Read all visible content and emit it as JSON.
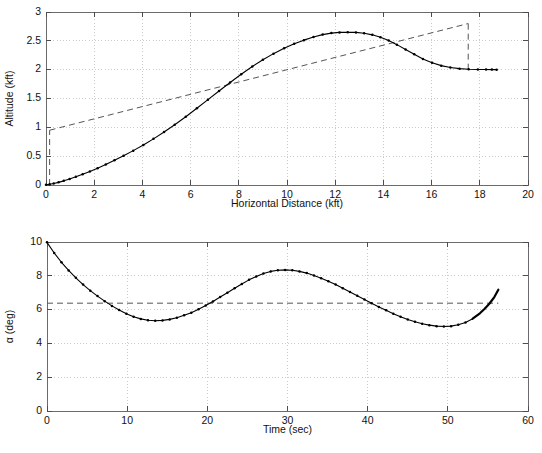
{
  "figure": {
    "title": "",
    "background": "#ffffff",
    "axis_color": "#4d4d4d",
    "grid_color": "#bdbdbd",
    "curve_color": "#000000",
    "refline_color": "#555555"
  },
  "chart_data": [
    {
      "id": "altitude-vs-distance",
      "type": "line",
      "title": "",
      "xlabel": "Horizontal Distance (kft)",
      "ylabel": "Altitude (kft)",
      "xlim": [
        0,
        20
      ],
      "ylim": [
        0,
        3
      ],
      "xticks": [
        0,
        2,
        4,
        6,
        8,
        10,
        12,
        14,
        16,
        18,
        20
      ],
      "xticklabels": [
        "0",
        "2",
        "4",
        "6",
        "8",
        "10",
        "12",
        "14",
        "16",
        "18",
        "20"
      ],
      "yticks": [
        0,
        0.5,
        1,
        1.5,
        2,
        2.5,
        3
      ],
      "yticklabels": [
        "0",
        "0.5",
        "1",
        "1.5",
        "2",
        "2.5",
        "3"
      ],
      "grid": true,
      "legend": "none",
      "markers": "dot",
      "series": [
        {
          "name": "trajectory",
          "style": "solid-with-markers",
          "x": [
            0.0,
            0.15,
            0.32,
            0.52,
            0.74,
            0.98,
            1.24,
            1.52,
            1.82,
            2.14,
            2.48,
            2.84,
            3.22,
            3.62,
            4.04,
            4.46,
            4.9,
            5.34,
            5.8,
            6.26,
            6.72,
            7.18,
            7.64,
            8.1,
            8.56,
            9.0,
            9.44,
            9.88,
            10.3,
            10.7,
            11.1,
            11.48,
            11.84,
            12.18,
            12.52,
            12.86,
            13.2,
            13.54,
            13.88,
            14.22,
            14.56,
            14.92,
            15.28,
            15.64,
            16.02,
            16.4,
            16.78,
            17.16,
            17.54,
            17.92,
            18.26,
            18.5,
            18.7
          ],
          "y": [
            0.005,
            0.012,
            0.026,
            0.046,
            0.072,
            0.104,
            0.142,
            0.186,
            0.236,
            0.292,
            0.356,
            0.428,
            0.508,
            0.596,
            0.694,
            0.8,
            0.918,
            1.046,
            1.184,
            1.33,
            1.48,
            1.63,
            1.778,
            1.92,
            2.054,
            2.172,
            2.278,
            2.37,
            2.448,
            2.512,
            2.568,
            2.608,
            2.634,
            2.646,
            2.65,
            2.646,
            2.632,
            2.604,
            2.562,
            2.504,
            2.434,
            2.35,
            2.266,
            2.186,
            2.12,
            2.07,
            2.038,
            2.018,
            2.008,
            2.004,
            2.002,
            2.001,
            2.0
          ]
        }
      ],
      "annotations": [
        {
          "name": "glide-slope-reference",
          "style": "dashed",
          "x": [
            0.15,
            17.52
          ],
          "y": [
            0.95,
            2.8
          ]
        },
        {
          "name": "start-vertical-marker",
          "style": "dashed",
          "x": [
            0.15,
            0.15
          ],
          "y": [
            0.0,
            0.95
          ]
        },
        {
          "name": "end-vertical-marker",
          "style": "dashed",
          "x": [
            17.52,
            17.52
          ],
          "y": [
            2.0,
            2.8
          ]
        }
      ]
    },
    {
      "id": "alpha-vs-time",
      "type": "line",
      "title": "",
      "xlabel": "Time (sec)",
      "ylabel": "α (deg)",
      "xlim": [
        0,
        60
      ],
      "ylim": [
        0,
        10
      ],
      "xticks": [
        0,
        10,
        20,
        30,
        40,
        50,
        60
      ],
      "xticklabels": [
        "0",
        "10",
        "20",
        "30",
        "40",
        "50",
        "60"
      ],
      "yticks": [
        0,
        2,
        4,
        6,
        8,
        10
      ],
      "yticklabels": [
        "0",
        "2",
        "4",
        "6",
        "8",
        "10"
      ],
      "grid": true,
      "legend": "none",
      "markers": "dot",
      "series": [
        {
          "name": "angle-of-attack",
          "style": "solid-with-markers",
          "x": [
            0.0,
            0.9,
            1.8,
            2.7,
            3.6,
            4.5,
            5.4,
            6.3,
            7.2,
            8.1,
            9.0,
            9.9,
            10.8,
            11.7,
            12.6,
            13.5,
            14.4,
            15.3,
            16.2,
            17.1,
            18.0,
            18.9,
            19.8,
            20.7,
            21.6,
            22.5,
            23.4,
            24.3,
            25.2,
            26.1,
            27.0,
            27.9,
            28.8,
            29.7,
            30.6,
            31.5,
            32.4,
            33.3,
            34.2,
            35.1,
            36.0,
            36.9,
            37.8,
            38.7,
            39.6,
            40.5,
            41.4,
            42.3,
            43.2,
            44.1,
            45.0,
            45.9,
            46.8,
            47.7,
            48.6,
            49.5,
            50.4,
            51.3,
            52.2,
            53.1,
            54.0,
            54.6,
            55.2,
            55.8,
            56.3
          ],
          "y": [
            9.98,
            9.35,
            8.8,
            8.32,
            7.88,
            7.48,
            7.12,
            6.8,
            6.5,
            6.22,
            5.98,
            5.76,
            5.58,
            5.45,
            5.37,
            5.34,
            5.36,
            5.42,
            5.52,
            5.66,
            5.82,
            6.02,
            6.24,
            6.48,
            6.74,
            7.0,
            7.26,
            7.52,
            7.76,
            7.96,
            8.14,
            8.26,
            8.33,
            8.35,
            8.33,
            8.26,
            8.16,
            8.02,
            7.86,
            7.68,
            7.48,
            7.26,
            7.04,
            6.82,
            6.6,
            6.38,
            6.16,
            5.96,
            5.76,
            5.58,
            5.42,
            5.28,
            5.16,
            5.08,
            5.02,
            5.0,
            5.02,
            5.1,
            5.24,
            5.46,
            5.78,
            6.05,
            6.36,
            6.74,
            7.18
          ],
          "thick_tail_from_index": 59
        }
      ],
      "annotations": [
        {
          "name": "trim-alpha-reference",
          "style": "dashed",
          "x": [
            0.0,
            56.3
          ],
          "y": [
            6.38,
            6.38
          ]
        }
      ]
    }
  ]
}
